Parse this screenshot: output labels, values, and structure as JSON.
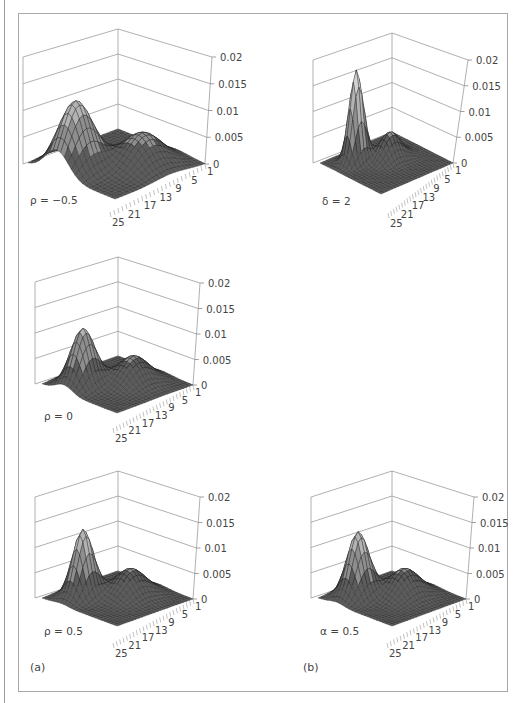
{
  "figure": {
    "panel_tags": {
      "a": "(a)",
      "b": "(b)"
    }
  },
  "chart_data": [
    {
      "type": "surface",
      "panel": "a",
      "label": "ρ = −0.5",
      "z_ticks": [
        "0.02",
        "0.015",
        "0.01",
        "0.005",
        "0"
      ],
      "z_range": [
        0,
        0.02
      ],
      "x_ticks": [
        "25",
        "21",
        "17",
        "13",
        "9",
        "5",
        "1"
      ],
      "grid_size": 25,
      "peaks": [
        {
          "x": 8,
          "y": 19,
          "height": 0.0135,
          "sx": 3.2,
          "sy": 3.6
        },
        {
          "x": 16,
          "y": 9,
          "height": 0.0065,
          "sx": 3.8,
          "sy": 4.2
        }
      ],
      "layout": {
        "back": [
          118,
          29
        ],
        "left": [
          23,
          57
        ],
        "right": [
          212,
          57
        ],
        "floor_back": [
          118,
          129
        ],
        "floor_left": [
          28,
          164
        ],
        "floor_right": [
          205,
          164
        ],
        "floor_front": [
          110,
          212
        ]
      }
    },
    {
      "type": "surface",
      "panel": "b",
      "label": "δ = 2",
      "z_ticks": [
        "0.02",
        "0.015",
        "0.01",
        "0.005",
        "0"
      ],
      "z_range": [
        0,
        0.02
      ],
      "x_ticks": [
        "25",
        "21",
        "17",
        "13",
        "9",
        "5",
        "1"
      ],
      "grid_size": 25,
      "peaks": [
        {
          "x": 6,
          "y": 17,
          "height": 0.0185,
          "sx": 1.6,
          "sy": 2.0
        },
        {
          "x": 11,
          "y": 10,
          "height": 0.0055,
          "sx": 2.4,
          "sy": 3.0
        }
      ],
      "layout": {
        "back": [
          392,
          33
        ],
        "left": [
          313,
          60
        ],
        "right": [
          468,
          60
        ],
        "floor_back": [
          392,
          132
        ],
        "floor_left": [
          320,
          163
        ],
        "floor_right": [
          453,
          163
        ],
        "floor_front": [
          388,
          213
        ]
      }
    },
    {
      "type": "surface",
      "panel": "a",
      "label": "ρ = 0",
      "z_ticks": [
        "0.02",
        "0.015",
        "0.01",
        "0.005",
        "0"
      ],
      "z_range": [
        0,
        0.02
      ],
      "x_ticks": [
        "25",
        "21",
        "17",
        "13",
        "9",
        "5",
        "1"
      ],
      "grid_size": 25,
      "peaks": [
        {
          "x": 7,
          "y": 18,
          "height": 0.0115,
          "sx": 2.6,
          "sy": 3.0
        },
        {
          "x": 14,
          "y": 9,
          "height": 0.0055,
          "sx": 3.5,
          "sy": 4.0
        }
      ],
      "layout": {
        "back": [
          118,
          257
        ],
        "left": [
          35,
          282
        ],
        "right": [
          200,
          283
        ],
        "floor_back": [
          118,
          356
        ],
        "floor_left": [
          42,
          384
        ],
        "floor_right": [
          193,
          385
        ],
        "floor_front": [
          113,
          428
        ]
      }
    },
    {
      "type": "surface",
      "panel": "a",
      "label": "ρ = 0.5",
      "z_ticks": [
        "0.02",
        "0.015",
        "0.01",
        "0.005",
        "0"
      ],
      "z_range": [
        0,
        0.02
      ],
      "x_ticks": [
        "25",
        "21",
        "17",
        "13",
        "9",
        "5",
        "1"
      ],
      "grid_size": 25,
      "peaks": [
        {
          "x": 6,
          "y": 17,
          "height": 0.0135,
          "sx": 2.2,
          "sy": 2.6
        },
        {
          "x": 13,
          "y": 9,
          "height": 0.0055,
          "sx": 3.4,
          "sy": 4.0
        }
      ],
      "layout": {
        "back": [
          118,
          471
        ],
        "left": [
          35,
          497
        ],
        "right": [
          200,
          497
        ],
        "floor_back": [
          118,
          571
        ],
        "floor_left": [
          42,
          598
        ],
        "floor_right": [
          193,
          599
        ],
        "floor_front": [
          113,
          643
        ]
      }
    },
    {
      "type": "surface",
      "panel": "b",
      "label": "α = 0.5",
      "z_ticks": [
        "0.02",
        "0.015",
        "0.01",
        "0.005",
        "0"
      ],
      "z_range": [
        0,
        0.02
      ],
      "x_ticks": [
        "25",
        "21",
        "17",
        "13",
        "9",
        "5",
        "1"
      ],
      "grid_size": 25,
      "peaks": [
        {
          "x": 6,
          "y": 17,
          "height": 0.013,
          "sx": 2.4,
          "sy": 2.8
        },
        {
          "x": 13,
          "y": 9,
          "height": 0.0055,
          "sx": 3.4,
          "sy": 4.0
        }
      ],
      "layout": {
        "back": [
          392,
          471
        ],
        "left": [
          311,
          497
        ],
        "right": [
          474,
          497
        ],
        "floor_back": [
          392,
          571
        ],
        "floor_left": [
          318,
          598
        ],
        "floor_right": [
          466,
          599
        ],
        "floor_front": [
          387,
          643
        ]
      }
    }
  ]
}
